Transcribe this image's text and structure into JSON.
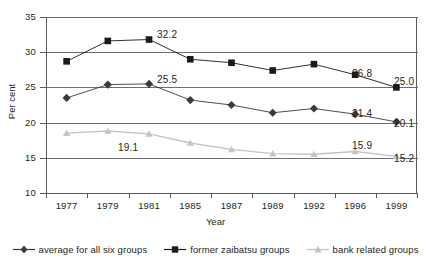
{
  "chart_data": {
    "type": "line",
    "title": "",
    "xlabel": "Year",
    "ylabel": "Per cent",
    "categories": [
      "1977",
      "1979",
      "1981",
      "1985",
      "1987",
      "1989",
      "1992",
      "1996",
      "1999"
    ],
    "ylim": [
      10,
      35
    ],
    "yticks": [
      10,
      15,
      20,
      25,
      30,
      35
    ],
    "grid": "horizontal",
    "legend_position": "bottom",
    "series": [
      {
        "name": "average for all six groups",
        "marker": "diamond",
        "color": "#3b3b3d",
        "values": [
          23.5,
          25.4,
          25.5,
          23.2,
          22.5,
          21.4,
          22.0,
          21.2,
          20.1
        ]
      },
      {
        "name": "former zaibatsu groups",
        "marker": "square",
        "color": "#1a1a1a",
        "values": [
          28.7,
          31.6,
          31.8,
          29.0,
          28.5,
          27.4,
          28.3,
          26.8,
          25.0
        ]
      },
      {
        "name": "bank related groups",
        "marker": "triangle",
        "color": "#c4c4c4",
        "values": [
          18.5,
          18.8,
          18.4,
          17.1,
          16.2,
          15.6,
          15.5,
          15.9,
          15.2
        ]
      }
    ],
    "annotations": [
      {
        "text": "32.2",
        "series": "former zaibatsu groups",
        "category": "1981"
      },
      {
        "text": "26.8",
        "series": "former zaibatsu groups",
        "category": "1996"
      },
      {
        "text": "25.0",
        "series": "former zaibatsu groups",
        "category": "1999"
      },
      {
        "text": "25.5",
        "series": "average for all six groups",
        "category": "1981"
      },
      {
        "text": "21.4",
        "series": "average for all six groups",
        "category": "1996"
      },
      {
        "text": "20.1",
        "series": "average for all six groups",
        "category": "1999"
      },
      {
        "text": "19.1",
        "series": "bank related groups",
        "category": "1981"
      },
      {
        "text": "15.9",
        "series": "bank related groups",
        "category": "1996"
      },
      {
        "text": "15.2",
        "series": "bank related groups",
        "category": "1999"
      }
    ]
  },
  "axis": {
    "y_tick_labels": [
      "35",
      "30",
      "25",
      "20",
      "15",
      "10"
    ],
    "x_tick_labels": [
      "1977",
      "1979",
      "1981",
      "1985",
      "1987",
      "1989",
      "1992",
      "1996",
      "1999"
    ],
    "x_title": "Year",
    "y_title": "Per cent"
  },
  "legend": {
    "items": [
      {
        "label": "average for all six groups",
        "marker": "diamond-marker",
        "color": "#3b3b3d"
      },
      {
        "label": "former zaibatsu groups",
        "marker": "square-marker",
        "color": "#1a1a1a"
      },
      {
        "label": "bank related groups",
        "marker": "triangle-marker",
        "color": "#c4c4c4"
      }
    ]
  },
  "annotation_labels": {
    "a0": "32.2",
    "a1": "26.8",
    "a2": "25.0",
    "a3": "25.5",
    "a4": "21.4",
    "a5": "20.1",
    "a6": "19.1",
    "a7": "15.9",
    "a8": "15.2"
  },
  "colors": {
    "axis": "#58595b",
    "grid": "#6d6e71",
    "series_average": "#3b3b3d",
    "series_zaibatsu": "#1a1a1a",
    "series_bank": "#c4c4c4",
    "background": "#ffffff"
  }
}
